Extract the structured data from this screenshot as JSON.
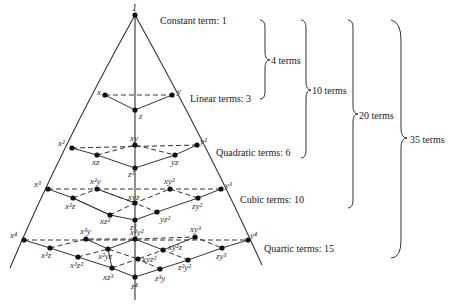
{
  "apex_label": "1",
  "levels": [
    {
      "label": "Constant term: 1",
      "degree": 0,
      "count": 1
    },
    {
      "label": "Linear terms: 3",
      "degree": 1,
      "count": 3
    },
    {
      "label": "Quadratic terms: 6",
      "degree": 2,
      "count": 6
    },
    {
      "label": "Cubic terms: 10",
      "degree": 3,
      "count": 10
    },
    {
      "label": "Quartic terms: 15",
      "degree": 4,
      "count": 15
    }
  ],
  "braces": [
    {
      "label": "4 terms",
      "covers": "degree 0-1"
    },
    {
      "label": "10 terms",
      "covers": "degree 0-2"
    },
    {
      "label": "20 terms",
      "covers": "degree 0-3"
    },
    {
      "label": "35 terms",
      "covers": "degree 0-4"
    }
  ],
  "terms": {
    "linear": [
      "x",
      "y",
      "z"
    ],
    "quadratic": [
      "x²",
      "xy",
      "y²",
      "xz",
      "yz",
      "z²"
    ],
    "cubic": [
      "x³",
      "x²y",
      "xy²",
      "y³",
      "x²z",
      "xyz",
      "zy²",
      "xz²",
      "yz²",
      "z³"
    ],
    "quartic": [
      "x⁴",
      "x³y",
      "x²y²",
      "xy³",
      "y⁴",
      "x³z",
      "x²yz",
      "xy²z",
      "zy³",
      "x²z²",
      "xyz²",
      "z²y²",
      "xz³",
      "z³y",
      "z⁴"
    ]
  },
  "colors": {
    "line": "#333333",
    "node": "#111111",
    "text": "#222222"
  }
}
